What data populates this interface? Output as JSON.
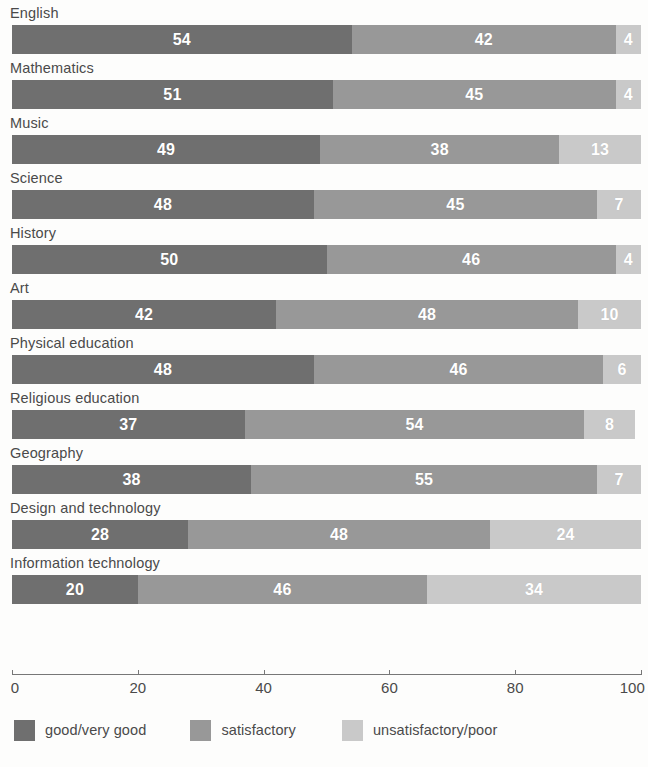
{
  "chart_data": {
    "type": "bar",
    "orientation": "horizontal",
    "stacked": true,
    "title": "",
    "subtitle": "",
    "xlabel": "",
    "ylabel": "",
    "xlim": [
      0,
      100
    ],
    "xticks": [
      0,
      20,
      40,
      60,
      80,
      100
    ],
    "xtick_labels": [
      "0",
      "20",
      "40",
      "60",
      "80",
      "100"
    ],
    "grid": false,
    "legend_position": "bottom-left",
    "categories": [
      "English",
      "Mathematics",
      "Music",
      "Science",
      "History",
      "Art",
      "Physical education",
      "Religious education",
      "Geography",
      "Design and technology",
      "Information technology"
    ],
    "series": [
      {
        "name": "good/very good",
        "color": "#6f6f6f",
        "values": [
          54,
          51,
          49,
          48,
          50,
          42,
          48,
          37,
          38,
          28,
          20
        ]
      },
      {
        "name": "satisfactory",
        "color": "#989898",
        "values": [
          42,
          45,
          38,
          45,
          46,
          48,
          46,
          54,
          55,
          48,
          46
        ]
      },
      {
        "name": "unsatisfactory/poor",
        "color": "#c9c9c9",
        "values": [
          4,
          4,
          13,
          7,
          4,
          10,
          6,
          8,
          7,
          24,
          34
        ]
      }
    ],
    "rows": [
      {
        "label": "English",
        "good": 54,
        "satisfactory": 42,
        "unsatisfactory": 4
      },
      {
        "label": "Mathematics",
        "good": 51,
        "satisfactory": 45,
        "unsatisfactory": 4
      },
      {
        "label": "Music",
        "good": 49,
        "satisfactory": 38,
        "unsatisfactory": 13
      },
      {
        "label": "Science",
        "good": 48,
        "satisfactory": 45,
        "unsatisfactory": 7
      },
      {
        "label": "History",
        "good": 50,
        "satisfactory": 46,
        "unsatisfactory": 4
      },
      {
        "label": "Art",
        "good": 42,
        "satisfactory": 48,
        "unsatisfactory": 10
      },
      {
        "label": "Physical education",
        "good": 48,
        "satisfactory": 46,
        "unsatisfactory": 6
      },
      {
        "label": "Religious education",
        "good": 37,
        "satisfactory": 54,
        "unsatisfactory": 8
      },
      {
        "label": "Geography",
        "good": 38,
        "satisfactory": 55,
        "unsatisfactory": 7
      },
      {
        "label": "Design and technology",
        "good": 28,
        "satisfactory": 48,
        "unsatisfactory": 24
      },
      {
        "label": "Information technology",
        "good": 20,
        "satisfactory": 46,
        "unsatisfactory": 34
      }
    ],
    "legend": [
      {
        "label": "good/very good",
        "color": "#6f6f6f"
      },
      {
        "label": "satisfactory",
        "color": "#989898"
      },
      {
        "label": "unsatisfactory/poor",
        "color": "#c9c9c9"
      }
    ]
  },
  "colors": {
    "good": "#6f6f6f",
    "satisfactory": "#989898",
    "unsatisfactory": "#c9c9c9",
    "axis": "#777777",
    "text": "#4a4a4a",
    "value_text": "#ffffff",
    "background": "#fdfdfc"
  }
}
